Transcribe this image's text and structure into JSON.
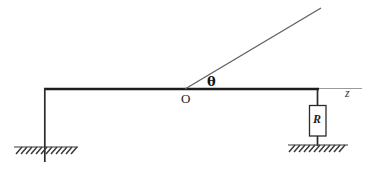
{
  "figure": {
    "type": "physics-circuit-diagram",
    "background_color": "#ffffff",
    "labels": {
      "angle": "θ",
      "origin": "O",
      "axis": "z",
      "resistor": "R"
    },
    "colors": {
      "rail": "#1a1a1a",
      "rod": "#555555",
      "axis_line": "#8a8a8a",
      "resistor_outline": "#2b2b2b",
      "ground_hatch": "#3a3a3a",
      "text": "#1a1a1a"
    },
    "geometry": {
      "origin_point": {
        "x": 185,
        "y": 89
      },
      "rail_left_x": 44,
      "rail_right_x": 318,
      "rail_y": 89,
      "rod_tip": {
        "x": 321,
        "y": 8
      },
      "axis_end_x": 362,
      "left_post_bottom_y": 162,
      "left_ground_y": 147,
      "right_ground_y": 145,
      "resistor_box": {
        "x": 309,
        "y": 105,
        "width": 17,
        "height": 31
      }
    }
  }
}
